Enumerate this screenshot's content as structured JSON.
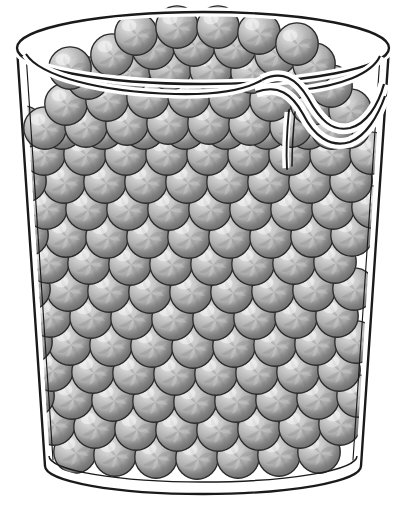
{
  "illustration": {
    "title": "Beaker filled with close-packed spheres",
    "subject": "laboratory-beaker",
    "caption": "",
    "background_color": "#ffffff",
    "line_color": "#1a1a1a",
    "style": "black-and-white line art with grayscale shaded spheres"
  },
  "beaker": {
    "name": "glass-beaker",
    "has_pour_spout": true,
    "spout_side": "right",
    "glass_fill_color": "#ffffff",
    "outline_color": "#1a1a1a",
    "outline_width": 2.2,
    "inner_wall_width": 1.1,
    "rim": {
      "name": "beaker-rim",
      "center_x": 203,
      "center_y": 48,
      "radius_x": 186,
      "radius_y": 36,
      "thickness": 11
    },
    "base": {
      "name": "beaker-base",
      "center_x": 203,
      "center_y": 466,
      "radius_x": 158,
      "radius_y": 28,
      "double_line_gap": 9
    },
    "body": {
      "top_left_x": 17,
      "top_right_x": 389,
      "bottom_left_x": 45,
      "bottom_right_x": 361,
      "top_y": 48,
      "bottom_y": 466
    }
  },
  "spheres": {
    "name": "packed-spheres",
    "description": "Close-packed identical spheres filling the beaker",
    "count_visible": 118,
    "rows": 12,
    "columns_per_row": 9,
    "packing": "hexagonal-close-packed",
    "diameter_px": 43,
    "colors": {
      "outline": "#2b2b2b",
      "highlight": "#e6e6e6",
      "mid": "#b3b3b3",
      "base": "#9a9a9a",
      "shadow": "#7d7d7d",
      "swirl_light": "#c8c8c8",
      "swirl_dark": "#8a8a8a"
    },
    "highlight_position": "upper-left",
    "surface_pattern": "pinwheel-swirl"
  },
  "labels": {
    "figure_number": "",
    "caption_text": ""
  }
}
